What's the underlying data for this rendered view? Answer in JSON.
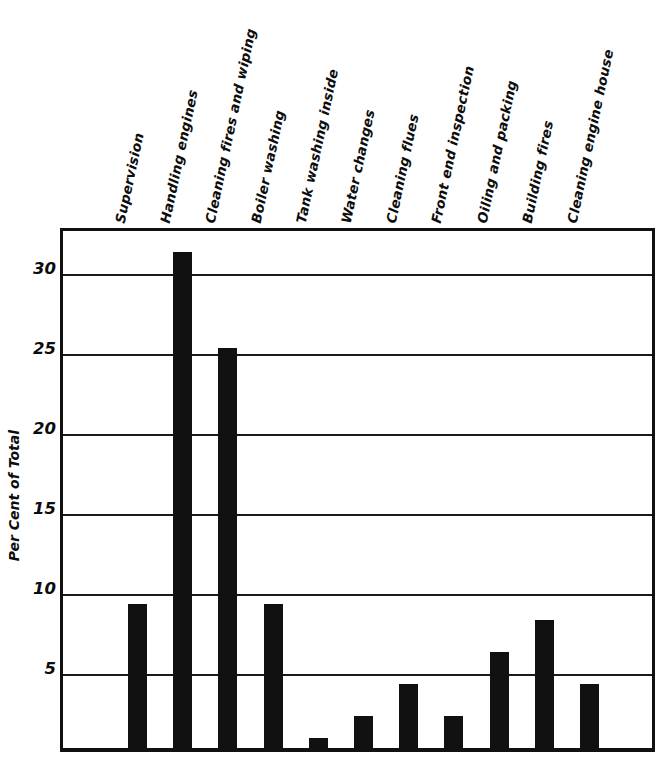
{
  "chart_data": {
    "type": "bar",
    "title": "",
    "subtitle": "",
    "xlabel": "",
    "ylabel": "Per Cent of Total",
    "ylim": [
      0,
      32.75
    ],
    "yticks": [
      5,
      10,
      15,
      20,
      25,
      30
    ],
    "ytick_labels": [
      "5",
      "10",
      "15",
      "20",
      "25",
      "30"
    ],
    "grid": true,
    "legend": false,
    "orientation": "vertical",
    "bar_color": "#111111",
    "frame_color": "#111111",
    "categories": [
      "Supervision",
      "Handling engines",
      "Cleaning fires and wiping",
      "Boiler washing",
      "Tank washing inside",
      "Water changes",
      "Cleaning flues",
      "Front end inspection",
      "Oiling and packing",
      "Building fires",
      "Cleaning engine house"
    ],
    "values": [
      9,
      31,
      25,
      9,
      0.6,
      2,
      4,
      2,
      6,
      8,
      4
    ]
  },
  "axis": {
    "y_title": "Per Cent of Total"
  }
}
